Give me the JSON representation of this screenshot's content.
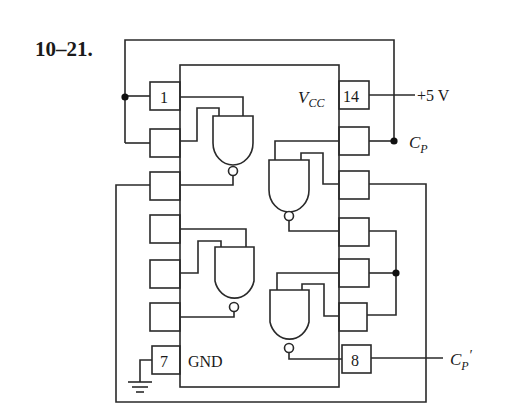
{
  "figure": {
    "problem_number": "10–21.",
    "chip": {
      "type": "14-pin DIP, quad 2-input NAND",
      "vcc_label": "V",
      "vcc_subscript": "CC",
      "gnd_label": "GND",
      "pins": {
        "pin1": "1",
        "pin7": "7",
        "pin8": "8",
        "pin14": "14"
      }
    },
    "external_labels": {
      "supply": "+5 V",
      "clock_in": "C",
      "clock_in_sub": "P",
      "clock_out": "C",
      "clock_out_sub": "P",
      "clock_out_prime": "′"
    },
    "colors": {
      "line": "#2a2a2a",
      "background": "#ffffff"
    }
  }
}
